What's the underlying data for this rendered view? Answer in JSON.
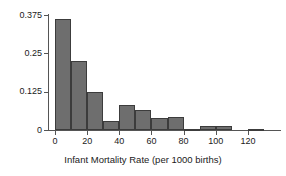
{
  "chart_data": {
    "type": "bar",
    "title": "",
    "subtitle": "",
    "xlabel": "Infant Mortality Rate (per 1000 births)",
    "ylabel": "",
    "xlim": [
      -3,
      135
    ],
    "ylim": [
      0,
      0.375
    ],
    "grid": false,
    "legend": null,
    "bin_width": 10,
    "x_tick_labels": [
      "0",
      "20",
      "40",
      "60",
      "80",
      "100",
      "120"
    ],
    "x_tick_values": [
      0,
      20,
      40,
      60,
      80,
      100,
      120
    ],
    "y_tick_labels": [
      "0.375",
      "0.25",
      "0.125",
      "0"
    ],
    "y_tick_values": [
      0.375,
      0.25,
      0.125,
      0
    ],
    "categories": [
      "0-10",
      "10-20",
      "20-30",
      "30-40",
      "40-50",
      "50-60",
      "60-70",
      "70-80",
      "80-90",
      "90-100",
      "100-110",
      "110-120",
      "120-130"
    ],
    "bin_starts": [
      0,
      10,
      20,
      30,
      40,
      50,
      60,
      70,
      80,
      90,
      100,
      110,
      120
    ],
    "bin_ends": [
      10,
      20,
      30,
      40,
      50,
      60,
      70,
      80,
      90,
      100,
      110,
      120,
      130
    ],
    "values": [
      0.363,
      0.226,
      0.124,
      0.03,
      0.08,
      0.066,
      0.038,
      0.044,
      0.003,
      0.012,
      0.012,
      0.0,
      0.002
    ],
    "bar_fill_color": "#6e6e6e",
    "bar_edge_color": "#3c3c3c",
    "axis_color": "#555555",
    "text_color": "#1a1a1a",
    "background_color": "#ffffff"
  }
}
